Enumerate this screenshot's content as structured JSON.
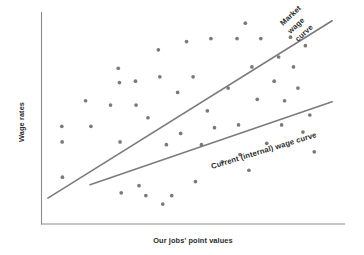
{
  "figure": {
    "background_color": "#ffffff",
    "axis_color": "#8a8a8a",
    "point_color": "#7a7a7a",
    "line_color": "#7b7b7b",
    "text_color": "#2b2b2b"
  },
  "chart_data": {
    "type": "scatter",
    "title": "",
    "xlabel": "Our jobs' point values",
    "ylabel": "Wage rates",
    "xlim": [
      0,
      100
    ],
    "ylim": [
      0,
      100
    ],
    "grid": false,
    "legend_position": "inline-annotation",
    "axis_ticks": {
      "x": [],
      "y": []
    },
    "points": [
      {
        "x": 6.0,
        "y": 44.3
      },
      {
        "x": 6.1,
        "y": 36.4
      },
      {
        "x": 6.2,
        "y": 18.6
      },
      {
        "x": 14.0,
        "y": 57.2
      },
      {
        "x": 15.8,
        "y": 44.3
      },
      {
        "x": 22.4,
        "y": 55.0
      },
      {
        "x": 25.0,
        "y": 73.6
      },
      {
        "x": 25.4,
        "y": 66.4
      },
      {
        "x": 25.6,
        "y": 36.4
      },
      {
        "x": 26.0,
        "y": 10.7
      },
      {
        "x": 30.8,
        "y": 67.1
      },
      {
        "x": 31.0,
        "y": 55.0
      },
      {
        "x": 32.0,
        "y": 14.3
      },
      {
        "x": 34.3,
        "y": 9.3
      },
      {
        "x": 35.0,
        "y": 48.6
      },
      {
        "x": 38.5,
        "y": 82.9
      },
      {
        "x": 39.0,
        "y": 69.3
      },
      {
        "x": 40.0,
        "y": 5.0
      },
      {
        "x": 41.2,
        "y": 35.0
      },
      {
        "x": 43.0,
        "y": 9.3
      },
      {
        "x": 45.0,
        "y": 61.4
      },
      {
        "x": 46.0,
        "y": 40.7
      },
      {
        "x": 48.0,
        "y": 87.1
      },
      {
        "x": 50.2,
        "y": 69.3
      },
      {
        "x": 51.0,
        "y": 16.4
      },
      {
        "x": 53.0,
        "y": 35.0
      },
      {
        "x": 55.0,
        "y": 52.1
      },
      {
        "x": 56.2,
        "y": 88.6
      },
      {
        "x": 57.4,
        "y": 43.6
      },
      {
        "x": 60.0,
        "y": 26.4
      },
      {
        "x": 62.0,
        "y": 63.6
      },
      {
        "x": 65.0,
        "y": 88.6
      },
      {
        "x": 65.5,
        "y": 45.0
      },
      {
        "x": 66.0,
        "y": 30.0
      },
      {
        "x": 67.8,
        "y": 96.4
      },
      {
        "x": 69.0,
        "y": 22.1
      },
      {
        "x": 70.0,
        "y": 74.3
      },
      {
        "x": 71.8,
        "y": 57.9
      },
      {
        "x": 73.0,
        "y": 88.6
      },
      {
        "x": 75.0,
        "y": 35.7
      },
      {
        "x": 77.5,
        "y": 67.1
      },
      {
        "x": 79.0,
        "y": 79.3
      },
      {
        "x": 80.0,
        "y": 45.0
      },
      {
        "x": 81.0,
        "y": 57.2
      },
      {
        "x": 83.0,
        "y": 89.3
      },
      {
        "x": 84.0,
        "y": 74.3
      },
      {
        "x": 85.5,
        "y": 63.6
      },
      {
        "x": 87.2,
        "y": 41.4
      },
      {
        "x": 88.0,
        "y": 85.0
      },
      {
        "x": 89.5,
        "y": 50.0
      },
      {
        "x": 91.0,
        "y": 31.4
      }
    ],
    "series": [
      {
        "name": "Market wage curve",
        "label": "Market\nwage\ncurve",
        "label_lines": [
          "Market",
          "wage",
          "curve"
        ],
        "type": "trend-line",
        "x_start": 1.3,
        "y_start": 8.0,
        "x_end": 97.0,
        "y_end": 97.6,
        "color": "#7b7b7b"
      },
      {
        "name": "Current (internal) wage curve",
        "label": "Current (internal) wage curve",
        "label_lines": [
          "Current (internal) wage curve"
        ],
        "type": "trend-line",
        "x_start": 15.5,
        "y_start": 14.8,
        "x_end": 97.0,
        "y_end": 56.7,
        "color": "#7b7b7b"
      }
    ]
  },
  "axes": {
    "y_axis_label": "Wage rates",
    "x_axis_label": "Our jobs' point values"
  },
  "annotations": {
    "market_line_1": "Market",
    "market_line_2": "wage",
    "market_line_3": "curve",
    "internal_line_1": "Current (internal) wage curve"
  }
}
